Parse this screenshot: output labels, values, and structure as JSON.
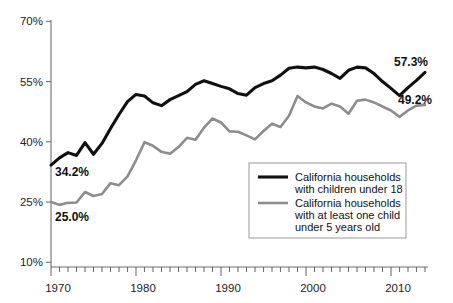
{
  "chart_data": {
    "type": "line",
    "title": "",
    "xlabel": "",
    "ylabel": "",
    "xlim": [
      1970,
      2014
    ],
    "ylim": [
      10,
      70
    ],
    "grid": false,
    "legend_position": "bottom-right",
    "y_tick_labels": [
      "70%",
      "55%",
      "40%",
      "25%",
      "10%"
    ],
    "y_tick_values": [
      70,
      55,
      40,
      25,
      10
    ],
    "x_tick_labels": [
      "1970",
      "1980",
      "1990",
      "2000",
      "2010"
    ],
    "x_tick_values": [
      1970,
      1980,
      1990,
      2000,
      2010
    ],
    "x_minor_tick_step": 1,
    "x": [
      1970,
      1971,
      1972,
      1973,
      1974,
      1975,
      1976,
      1977,
      1978,
      1979,
      1980,
      1981,
      1982,
      1983,
      1984,
      1985,
      1986,
      1987,
      1988,
      1989,
      1990,
      1991,
      1992,
      1993,
      1994,
      1995,
      1996,
      1997,
      1998,
      1999,
      2000,
      2001,
      2002,
      2003,
      2004,
      2005,
      2006,
      2007,
      2008,
      2009,
      2010,
      2011,
      2012,
      2013,
      2014
    ],
    "series": [
      {
        "name": "California households with children under 18",
        "color": "#101010",
        "values": [
          34.2,
          36.0,
          37.3,
          36.6,
          39.8,
          36.9,
          39.6,
          43.3,
          46.8,
          50.0,
          51.8,
          51.4,
          49.7,
          49.0,
          50.5,
          51.5,
          52.5,
          54.3,
          55.2,
          54.5,
          53.8,
          53.2,
          52.0,
          51.6,
          53.5,
          54.5,
          55.2,
          56.6,
          58.3,
          58.6,
          58.4,
          58.6,
          58.0,
          57.0,
          55.8,
          57.8,
          58.6,
          58.4,
          57.0,
          55.0,
          53.3,
          51.5,
          53.5,
          55.3,
          57.3
        ]
      },
      {
        "name": "California households with at least one child under 5 years old",
        "color": "#8d8d8d",
        "values": [
          25.0,
          24.3,
          24.8,
          24.9,
          27.5,
          26.5,
          27.0,
          29.7,
          29.2,
          31.4,
          35.4,
          39.9,
          39.0,
          37.5,
          37.0,
          38.7,
          41.0,
          40.5,
          43.5,
          45.8,
          44.8,
          42.6,
          42.5,
          41.6,
          40.6,
          42.7,
          44.5,
          43.7,
          46.5,
          51.4,
          49.8,
          48.8,
          48.3,
          49.5,
          48.8,
          47.0,
          50.2,
          50.5,
          49.8,
          48.8,
          47.8,
          46.2,
          47.8,
          49.0,
          49.2
        ]
      }
    ],
    "annotations": [
      {
        "id": "start-primary",
        "text": "34.2%",
        "x": 1970,
        "y": 34.2
      },
      {
        "id": "start-secondary",
        "text": "25.0%",
        "x": 1970,
        "y": 25.0
      },
      {
        "id": "end-primary",
        "text": "57.3%",
        "x": 2014,
        "y": 57.3
      },
      {
        "id": "end-secondary",
        "text": "49.2%",
        "x": 2014,
        "y": 49.2
      }
    ],
    "legend": [
      {
        "line1": "California households",
        "line2": "with children under 18",
        "line3": "",
        "color": "#101010"
      },
      {
        "line1": "California households",
        "line2": "with at least one child",
        "line3": "under 5 years old",
        "color": "#8d8d8d"
      }
    ]
  }
}
